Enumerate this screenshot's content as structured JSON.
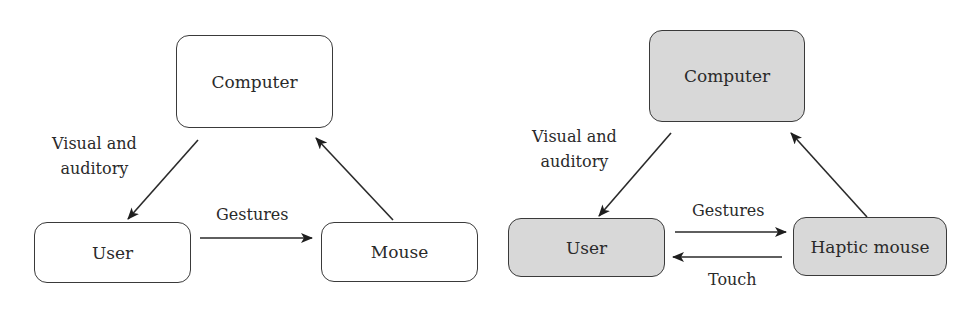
{
  "left_diagram": {
    "nodes": {
      "computer": "Computer",
      "user": "User",
      "mouse": "Mouse"
    },
    "edges": {
      "computer_to_user": [
        "Visual and",
        "auditory"
      ],
      "user_to_mouse": "Gestures",
      "mouse_to_computer": ""
    },
    "fill": "#ffffff"
  },
  "right_diagram": {
    "nodes": {
      "computer": "Computer",
      "user": "User",
      "haptic_mouse": "Haptic mouse"
    },
    "edges": {
      "computer_to_user": [
        "Visual and",
        "auditory"
      ],
      "user_to_haptic_mouse": "Gestures",
      "haptic_mouse_to_user": "Touch",
      "haptic_mouse_to_computer": ""
    },
    "fill": "#d8d8d8"
  }
}
